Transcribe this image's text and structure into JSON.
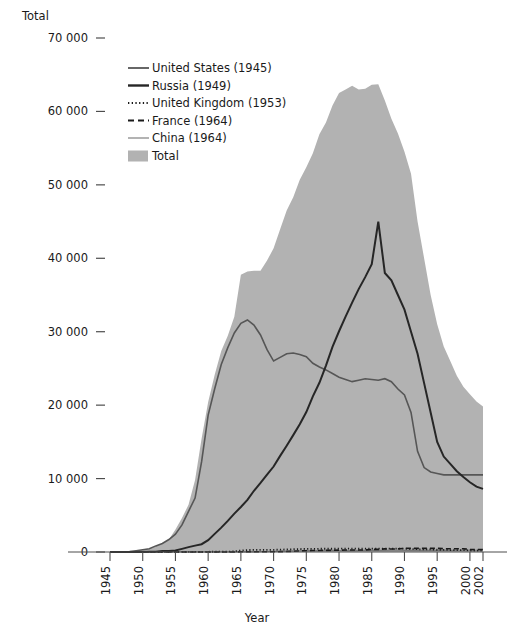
{
  "chart_data": {
    "type": "area",
    "title": "",
    "ylabel": "Total",
    "xlabel": "Year",
    "ylim": [
      0,
      70000
    ],
    "xlim": [
      1945,
      2002
    ],
    "grid": false,
    "legend_position": "top-left-inside",
    "ytick_labels": [
      "70 000",
      "60 000",
      "50 000",
      "40 000",
      "30 000",
      "20 000",
      "10 000",
      "0"
    ],
    "ytick_values": [
      70000,
      60000,
      50000,
      40000,
      30000,
      20000,
      10000,
      0
    ],
    "xtick_labels": [
      "1945",
      "1950",
      "1955",
      "1960",
      "1965",
      "1970",
      "1975",
      "1980",
      "1985",
      "1990",
      "1995",
      "2000",
      "2002"
    ],
    "xtick_values": [
      1945,
      1950,
      1955,
      1960,
      1965,
      1970,
      1975,
      1980,
      1985,
      1990,
      1995,
      2000,
      2002
    ],
    "x": [
      1945,
      1946,
      1947,
      1948,
      1949,
      1950,
      1951,
      1952,
      1953,
      1954,
      1955,
      1956,
      1957,
      1958,
      1959,
      1960,
      1961,
      1962,
      1963,
      1964,
      1965,
      1966,
      1967,
      1968,
      1969,
      1970,
      1971,
      1972,
      1973,
      1974,
      1975,
      1976,
      1977,
      1978,
      1979,
      1980,
      1981,
      1982,
      1983,
      1984,
      1985,
      1986,
      1987,
      1988,
      1989,
      1990,
      1991,
      1992,
      1993,
      1994,
      1995,
      1996,
      1997,
      1998,
      1999,
      2000,
      2001,
      2002
    ],
    "series": [
      {
        "name": "Total",
        "label": "Total",
        "kind": "area",
        "color": "#b2b2b2",
        "values": [
          2,
          9,
          13,
          50,
          170,
          299,
          438,
          832,
          1161,
          1703,
          3057,
          4618,
          6444,
          9822,
          15468,
          20434,
          24126,
          27387,
          29459,
          32041,
          37741,
          38217,
          38310,
          38302,
          39691,
          41365,
          43968,
          46500,
          48300,
          50700,
          52400,
          54300,
          56900,
          58500,
          60800,
          62500,
          63000,
          63500,
          63000,
          63100,
          63632,
          63700,
          61500,
          59000,
          57000,
          54500,
          51500,
          45000,
          40000,
          35000,
          31000,
          28000,
          26000,
          24000,
          22500,
          21500,
          20500,
          19800
        ]
      },
      {
        "name": "United States",
        "label": "United States (1945)",
        "kind": "line",
        "first_test_year": 1945,
        "color": "#565656",
        "values": [
          2,
          9,
          13,
          50,
          170,
          299,
          438,
          832,
          1161,
          1703,
          2422,
          3692,
          5543,
          7345,
          12298,
          18638,
          22229,
          25540,
          27826,
          29826,
          31139,
          31601,
          30893,
          29561,
          27552,
          26008,
          26500,
          27000,
          27100,
          26900,
          26600,
          25700,
          25200,
          24800,
          24300,
          23800,
          23500,
          23200,
          23400,
          23600,
          23500,
          23400,
          23600,
          23200,
          22200,
          21400,
          19000,
          13700,
          11500,
          10900,
          10700,
          10500,
          10500,
          10500,
          10500,
          10500,
          10500,
          10500
        ]
      },
      {
        "name": "Russia",
        "label": "Russia (1949)",
        "kind": "line",
        "first_test_year": 1949,
        "color": "#262626",
        "values": [
          0,
          0,
          0,
          0,
          1,
          5,
          25,
          50,
          120,
          150,
          200,
          426,
          660,
          869,
          1060,
          1605,
          2471,
          3322,
          4238,
          5221,
          6129,
          7089,
          8339,
          9399,
          10538,
          11643,
          13092,
          14478,
          15915,
          17385,
          19055,
          21205,
          23044,
          25393,
          27935,
          30062,
          32049,
          33952,
          35804,
          37431,
          39197,
          45000,
          38000,
          37000,
          35000,
          33000,
          30000,
          27000,
          23000,
          19000,
          15000,
          13000,
          12000,
          11000,
          10200,
          9500,
          8900,
          8600
        ]
      },
      {
        "name": "United Kingdom",
        "label": "United Kingdom (1953)",
        "kind": "dotted",
        "first_test_year": 1953,
        "color": "#1a1a1a",
        "values": [
          0,
          0,
          0,
          0,
          0,
          0,
          0,
          0,
          1,
          5,
          10,
          15,
          20,
          22,
          25,
          30,
          35,
          40,
          50,
          80,
          200,
          270,
          280,
          280,
          290,
          300,
          320,
          350,
          380,
          400,
          420,
          430,
          440,
          440,
          440,
          450,
          450,
          450,
          450,
          450,
          450,
          450,
          450,
          450,
          450,
          450,
          400,
          380,
          360,
          350,
          300,
          300,
          260,
          260,
          260,
          200,
          200,
          200
        ]
      },
      {
        "name": "France",
        "label": "France (1964)",
        "kind": "dashed",
        "first_test_year": 1964,
        "color": "#1a1a1a",
        "values": [
          0,
          0,
          0,
          0,
          0,
          0,
          0,
          0,
          0,
          0,
          0,
          0,
          0,
          0,
          0,
          0,
          0,
          0,
          0,
          4,
          32,
          36,
          36,
          36,
          36,
          36,
          45,
          70,
          100,
          150,
          180,
          200,
          210,
          220,
          230,
          250,
          274,
          274,
          280,
          280,
          360,
          355,
          420,
          410,
          420,
          505,
          500,
          500,
          500,
          500,
          500,
          450,
          450,
          450,
          450,
          350,
          350,
          350
        ]
      },
      {
        "name": "China",
        "label": "China (1964)",
        "kind": "line-thin",
        "first_test_year": 1964,
        "color": "#767676",
        "values": [
          0,
          0,
          0,
          0,
          0,
          0,
          0,
          0,
          0,
          0,
          0,
          0,
          0,
          0,
          0,
          0,
          0,
          0,
          0,
          1,
          5,
          20,
          25,
          35,
          50,
          75,
          100,
          130,
          150,
          170,
          185,
          190,
          200,
          220,
          235,
          205,
          200,
          200,
          210,
          220,
          224,
          224,
          230,
          240,
          240,
          232,
          234,
          234,
          234,
          234,
          234,
          234,
          234,
          235,
          235,
          235,
          235,
          235
        ]
      }
    ]
  },
  "axes": {
    "y_axis_title": "Total",
    "x_axis_title": "Year"
  },
  "legend": {
    "entries": [
      {
        "label": "United States (1945)",
        "style": "solid-medium",
        "color": "#565656"
      },
      {
        "label": "Russia (1949)",
        "style": "solid-bold",
        "color": "#262626"
      },
      {
        "label": "United Kingdom (1953)",
        "style": "dotted",
        "color": "#1a1a1a"
      },
      {
        "label": "France (1964)",
        "style": "dashed",
        "color": "#1a1a1a"
      },
      {
        "label": "China (1964)",
        "style": "solid-thin",
        "color": "#767676"
      },
      {
        "label": "Total",
        "style": "swatch",
        "color": "#b2b2b2"
      }
    ]
  },
  "colors": {
    "background": "#ffffff",
    "area_fill": "#b2b2b2",
    "axis": "#4d4d4d",
    "text": "#1a1a1a"
  }
}
